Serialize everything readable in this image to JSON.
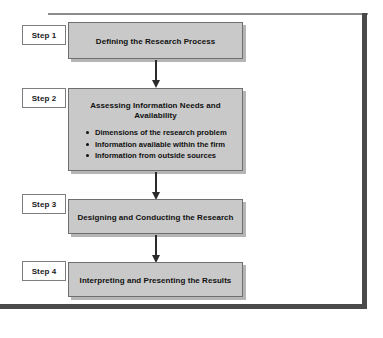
{
  "figure": {
    "frame": {
      "top_rule": "",
      "right_rule": "",
      "bottom_rule": ""
    },
    "accent_colors": {
      "box_fill": "#c9c9c9",
      "box_border": "#6e6e6e",
      "frame_dark": "#4a4a4a",
      "frame_light": "#8d8d8d",
      "text": "#111111",
      "page_background": "#ffffff"
    },
    "steps": [
      {
        "tag": "Step 1",
        "title": "Defining the Research Process",
        "bullets": []
      },
      {
        "tag": "Step 2",
        "title": "Assessing Information Needs and Availability",
        "bullets": [
          "Dimensions of the research problem",
          "Information available within the firm",
          "Information from outside sources"
        ]
      },
      {
        "tag": "Step 3",
        "title": "Designing and Conducting the Research",
        "bullets": []
      },
      {
        "tag": "Step 4",
        "title": "Interpreting and Presenting the Results",
        "bullets": []
      }
    ],
    "connectors": [
      {
        "from": "Step 1",
        "to": "Step 2"
      },
      {
        "from": "Step 2",
        "to": "Step 3"
      },
      {
        "from": "Step 3",
        "to": "Step 4"
      }
    ]
  }
}
